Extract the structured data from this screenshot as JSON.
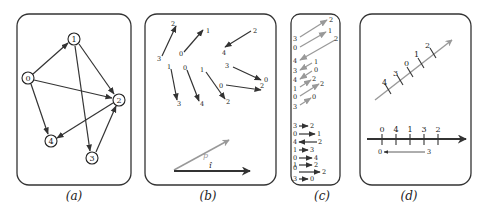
{
  "panels": {
    "a": {
      "caption": "(a)",
      "nodes": [
        {
          "id": "0",
          "x": 28,
          "y": 78
        },
        {
          "id": "1",
          "x": 74,
          "y": 39
        },
        {
          "id": "2",
          "x": 119,
          "y": 100
        },
        {
          "id": "3",
          "x": 92,
          "y": 158
        },
        {
          "id": "4",
          "x": 51,
          "y": 141
        }
      ],
      "edges": [
        [
          "0",
          "1"
        ],
        [
          "0",
          "2"
        ],
        [
          "0",
          "4"
        ],
        [
          "1",
          "2"
        ],
        [
          "1",
          "3"
        ],
        [
          "3",
          "2"
        ],
        [
          "2",
          "4"
        ]
      ]
    },
    "b": {
      "caption": "(b)",
      "pairs": [
        {
          "from": "3",
          "to": "2"
        },
        {
          "from": "0",
          "to": "1"
        },
        {
          "from": "2",
          "to": "4"
        },
        {
          "from": "1",
          "to": "3"
        },
        {
          "from": "0",
          "to": "4"
        },
        {
          "from": "1",
          "to": "2"
        },
        {
          "from": "3",
          "to": "0"
        },
        {
          "from": "0",
          "to": "2"
        }
      ],
      "vector_p_label": "p",
      "vector_i_label": "î"
    },
    "c": {
      "caption": "(c)",
      "projected_pairs": [
        {
          "from": "3",
          "to": "2"
        },
        {
          "from": "0",
          "to": "1"
        },
        {
          "from": "2",
          "to": "4"
        },
        {
          "from": "1",
          "to": "3"
        },
        {
          "from": "0",
          "to": "4"
        },
        {
          "from": "1",
          "to": "2"
        },
        {
          "from": "0",
          "to": "2"
        },
        {
          "from": "3",
          "to": "0"
        }
      ],
      "horizontal_pairs": [
        {
          "from": "3",
          "to": "2"
        },
        {
          "from": "0",
          "to": "1"
        },
        {
          "from": "2",
          "to": "4"
        },
        {
          "from": "1",
          "to": "3"
        },
        {
          "from": "0",
          "to": "4"
        },
        {
          "from": "1",
          "to": "2"
        },
        {
          "from": "0",
          "to": "2"
        },
        {
          "from": "3",
          "to": "0"
        }
      ]
    },
    "d": {
      "caption": "(d)",
      "diagonal_order": [
        "4",
        "3",
        "0",
        "1",
        "2"
      ],
      "axis_order": [
        "0",
        "4",
        "1",
        "3",
        "2"
      ],
      "small_arrow": {
        "from": "3",
        "to": "0"
      }
    }
  }
}
